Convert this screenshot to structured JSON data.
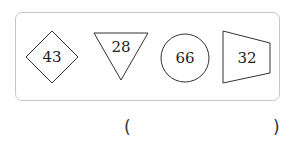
{
  "figure": {
    "shapes": [
      {
        "type": "diamond",
        "label": "43"
      },
      {
        "type": "inverted-triangle",
        "label": "28"
      },
      {
        "type": "circle",
        "label": "66"
      },
      {
        "type": "trapezoid",
        "label": "32"
      }
    ],
    "stroke_color": "#333333",
    "border_color": "#c8c8c8"
  },
  "answer": {
    "open_paren": "(",
    "close_paren": ")"
  }
}
